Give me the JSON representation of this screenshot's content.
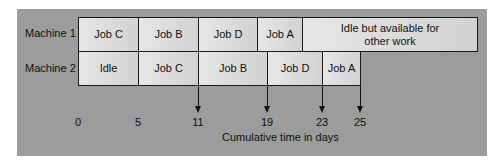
{
  "diagram": {
    "rows": [
      {
        "label": "Machine 1",
        "segments": [
          {
            "label": "Job C",
            "start": 0,
            "end": 5
          },
          {
            "label": "Job B",
            "start": 5,
            "end": 11
          },
          {
            "label": "Job D",
            "start": 11,
            "end": 15
          },
          {
            "label": "Job A",
            "start": 15,
            "end": 19
          },
          {
            "label": "Idle but available for other work",
            "start": 19,
            "end": null
          }
        ]
      },
      {
        "label": "Machine 2",
        "segments": [
          {
            "label": "Idle",
            "start": 0,
            "end": 5
          },
          {
            "label": "Job C",
            "start": 5,
            "end": 11
          },
          {
            "label": "Job B",
            "start": 11,
            "end": 19
          },
          {
            "label": "Job D",
            "start": 19,
            "end": 23
          },
          {
            "label": "Job A",
            "start": 23,
            "end": 25
          }
        ]
      }
    ],
    "ticks": [
      "0",
      "5",
      "11",
      "19",
      "23",
      "25"
    ],
    "arrow_ticks": [
      "11",
      "19",
      "23",
      "25"
    ],
    "xlabel": "Cumulative time in days",
    "m1_idle_line1": "Idle but available for",
    "m1_idle_line2": "other work"
  },
  "colors": {
    "panel": "#9c9c9c",
    "cell": "#dcdcdc",
    "border": "#1a1a1a"
  }
}
